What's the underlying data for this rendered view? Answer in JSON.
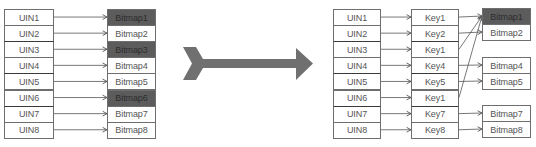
{
  "colors": {
    "border": "#6e6e6e",
    "dark_fill": "#5c5c5c",
    "text": "#555555",
    "big_arrow": "#707070",
    "connector": "#555555"
  },
  "left_diagram": {
    "uin_column": [
      "UIN1",
      "UIN2",
      "UIN3",
      "UIN4",
      "UIN5",
      "UIN6",
      "UIN7",
      "UIN8"
    ],
    "bitmap_column": [
      {
        "label": "Bitmap1",
        "dark": true
      },
      {
        "label": "Bitmap2",
        "dark": false
      },
      {
        "label": "Bitmap3",
        "dark": true
      },
      {
        "label": "Bitmap4",
        "dark": false
      },
      {
        "label": "Bitmap5",
        "dark": false
      },
      {
        "label": "Bitmap6",
        "dark": true
      },
      {
        "label": "Bitmap7",
        "dark": false
      },
      {
        "label": "Bitmap8",
        "dark": false
      }
    ],
    "mappings": [
      [
        0,
        0
      ],
      [
        1,
        1
      ],
      [
        2,
        2
      ],
      [
        3,
        3
      ],
      [
        4,
        4
      ],
      [
        5,
        5
      ],
      [
        6,
        6
      ],
      [
        7,
        7
      ]
    ]
  },
  "transform_arrow": {
    "direction": "right",
    "style": "chevron-arrow"
  },
  "right_diagram": {
    "uin_column": [
      "UIN1",
      "UIN2",
      "UIN3",
      "UIN4",
      "UIN5",
      "UIN6",
      "UIN7",
      "UIN8"
    ],
    "key_column": [
      "Key1",
      "Key2",
      "Key1",
      "Key4",
      "Key5",
      "Key1",
      "Key7",
      "Key8"
    ],
    "bitmap_groups": [
      {
        "items": [
          {
            "label": "Bitmap1",
            "dark": true
          },
          {
            "label": "Bitmap2",
            "dark": false
          }
        ],
        "top": 8
      },
      {
        "items": [
          {
            "label": "Bitmap4",
            "dark": false
          },
          {
            "label": "Bitmap5",
            "dark": false
          }
        ],
        "top": 57
      },
      {
        "items": [
          {
            "label": "Bitmap7",
            "dark": false
          },
          {
            "label": "Bitmap8",
            "dark": false
          }
        ],
        "top": 105
      }
    ],
    "key_to_bitmap": [
      {
        "key_row": 0,
        "bitmap": "Bitmap1"
      },
      {
        "key_row": 1,
        "bitmap": "Bitmap2"
      },
      {
        "key_row": 2,
        "bitmap": "Bitmap1"
      },
      {
        "key_row": 3,
        "bitmap": "Bitmap4"
      },
      {
        "key_row": 4,
        "bitmap": "Bitmap5"
      },
      {
        "key_row": 5,
        "bitmap": "Bitmap1"
      },
      {
        "key_row": 6,
        "bitmap": "Bitmap7"
      },
      {
        "key_row": 7,
        "bitmap": "Bitmap8"
      }
    ]
  }
}
